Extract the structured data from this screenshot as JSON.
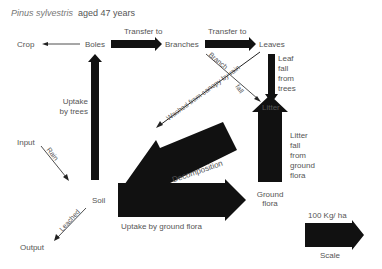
{
  "title": {
    "species": "Pinus sylvestris",
    "age": "aged 47 years"
  },
  "nodes": {
    "crop": "Crop",
    "boles": "Boles",
    "branches": "Branches",
    "leaves": "Leaves",
    "litter": "Litter",
    "soil": "Soil",
    "ground_flora_1": "Ground",
    "ground_flora_2": "flora",
    "input": "Input",
    "output": "Output"
  },
  "flows": {
    "transfer_to_branches": "Transfer to",
    "transfer_to_leaves": "Transfer to",
    "leaf_fall": [
      "Leaf",
      "fall",
      "from",
      "trees"
    ],
    "branch_fall_1": "Branch",
    "branch_fall_2": "fall",
    "washed_from_canopy": "Washed from canopy by rain",
    "uptake_by_trees": [
      "Uptake",
      "by trees"
    ],
    "rain": "Rain",
    "leached": "Leached",
    "decomposition": "Decomposition",
    "litter_fall_ground_flora": [
      "Litter",
      "fall",
      "from",
      "ground",
      "flora"
    ],
    "uptake_by_ground_flora": "Uptake by ground flora"
  },
  "scale": {
    "value": "100 Kg/ ha",
    "label": "Scale"
  },
  "colors": {
    "arrow": "#111111",
    "text": "#555555",
    "background": "#ffffff"
  }
}
